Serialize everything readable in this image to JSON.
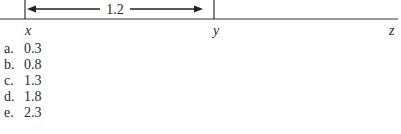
{
  "diagram": {
    "points": [
      {
        "label": "x"
      },
      {
        "label": "y"
      },
      {
        "label": "z"
      }
    ],
    "segment_label": "1.2"
  },
  "options": [
    {
      "letter": "a.",
      "value": "0.3"
    },
    {
      "letter": "b.",
      "value": "0.8"
    },
    {
      "letter": "c.",
      "value": "1.3"
    },
    {
      "letter": "d.",
      "value": "1.8"
    },
    {
      "letter": "e.",
      "value": "2.3"
    }
  ]
}
